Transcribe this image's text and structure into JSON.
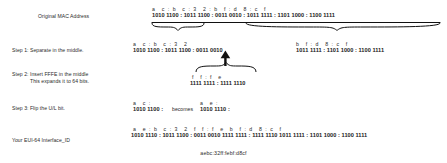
{
  "labels": {
    "original": "Original MAC Address",
    "step1": "Step 1: Separate in the middle.",
    "step2_line1": "Step 2: Insert FFFE in the middle",
    "step2_line2": "This expands it to 64 bits.",
    "step3": "Step 3: Flip the U/L bit.",
    "result": "Your EUI-64 Interface_ID"
  },
  "rows": {
    "original": {
      "hex": "a    c  :  b    c  :  3    2  :  b    f  :  d    8  :  c    f",
      "bin": "1010 1100 : 1011 1100 : 0011 0010 : 1011 1111 : 1101 1000 : 1100 1111"
    },
    "step1_left": {
      "hex": "a    c  :  b    c  :  3    2",
      "bin": "1010 1100 : 1011 1100 : 0011 0010"
    },
    "step1_right": {
      "hex": "b    f  :  d    8  :  c    f",
      "bin": "1011 1111 : 1101 1000 : 1100 1111"
    },
    "ffffe": {
      "hex": "f    f  :  f    e",
      "bin": "1111 1111 : 1111 1110"
    },
    "step3_before": {
      "hex": "a    c  :",
      "bin": "1010 1100 :"
    },
    "step3_becomes": "becomes",
    "step3_after": {
      "hex": "a    e  :",
      "bin": "1010 1110 :"
    },
    "result": {
      "hex": "a    e  :  b    c  :  3    2    f    f  :  f    e    b    f  :  d    8  :  c    f",
      "bin": "1010 1110 : 1011 1100 : 0011 0010 1111 1111 : 1111 1110 1011 1111 : 1101 1000 : 1100 1111"
    },
    "final_hex": "aebc:32ff:febf:d8cf"
  },
  "colors": {
    "background": "#ffffff",
    "text": "#1a1a1a",
    "label": "#2b2b2b",
    "stroke": "#111111"
  }
}
